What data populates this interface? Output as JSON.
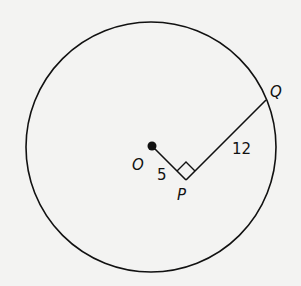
{
  "diagram": {
    "type": "geometry-circle",
    "points": {
      "O": {
        "label": "O",
        "description": "center of circle"
      },
      "P": {
        "label": "P",
        "description": "foot of perpendicular, right angle"
      },
      "Q": {
        "label": "Q",
        "description": "point on circle"
      }
    },
    "segments": [
      {
        "from": "O",
        "to": "P",
        "length_label": "5"
      },
      {
        "from": "P",
        "to": "Q",
        "length_label": "12"
      }
    ],
    "right_angle_at": "P",
    "colors": {
      "stroke": "#111111",
      "background": "#f3f3f2"
    }
  }
}
